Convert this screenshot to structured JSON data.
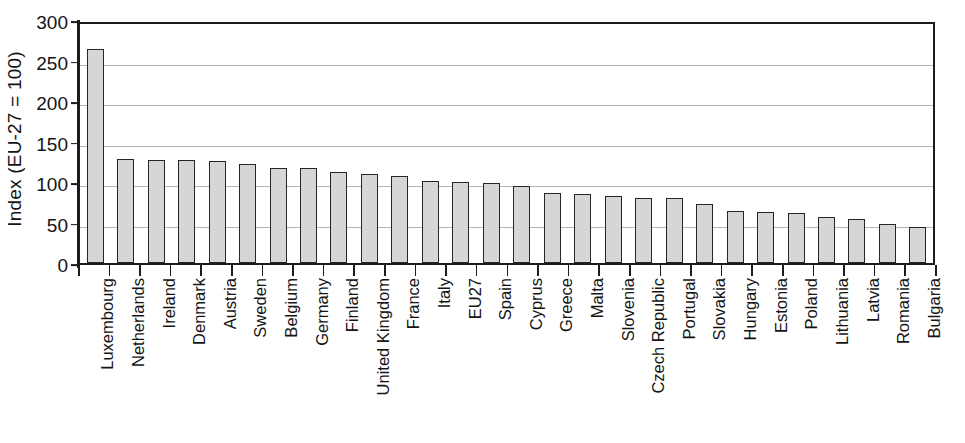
{
  "chart_data": {
    "type": "bar",
    "title": "",
    "subtitle": "",
    "xlabel": "",
    "ylabel": "Index (EU-27 = 100)",
    "ylim": [
      0,
      300
    ],
    "ytick_labels": [
      "300",
      "250",
      "200",
      "150",
      "100",
      "50",
      "0"
    ],
    "yticks": [
      300,
      250,
      200,
      150,
      100,
      50,
      0
    ],
    "grid": true,
    "gridlines_at": [
      250,
      200,
      150,
      100,
      50
    ],
    "legend": null,
    "legend_position": "none",
    "categories": [
      "Luxembourg",
      "Netherlands",
      "Ireland",
      "Denmark",
      "Austria",
      "Sweden",
      "Belgium",
      "Germany",
      "Finland",
      "United Kingdom",
      "France",
      "Italy",
      "EU27",
      "Spain",
      "Cyprus",
      "Greece",
      "Malta",
      "Slovenia",
      "Czech Republic",
      "Portugal",
      "Slovakia",
      "Hungary",
      "Estonia",
      "Poland",
      "Lithuania",
      "Latvia",
      "Romania",
      "Bulgaria"
    ],
    "values": [
      264,
      129,
      127,
      127,
      126,
      122,
      117,
      117,
      112,
      110,
      107,
      101,
      100,
      99,
      95,
      87,
      85,
      83,
      80,
      80,
      73,
      64,
      63,
      62,
      57,
      54,
      48,
      45
    ],
    "bar_fill_color": "#d6d6d6",
    "bar_edge_color": "#262626",
    "axis_color": "#1c1c1c",
    "gridline_color": "#b4b4b4",
    "background_color": "#ffffff"
  }
}
